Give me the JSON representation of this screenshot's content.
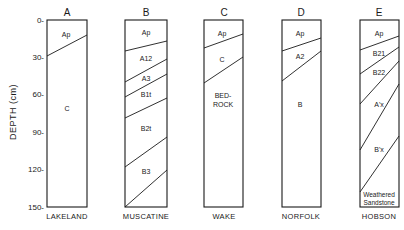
{
  "axis": {
    "label": "DEPTH (cm)",
    "ticks": [
      "0-",
      "30-",
      "60-",
      "90-",
      "120-",
      "150-"
    ],
    "tick_values": [
      0,
      30,
      60,
      90,
      120,
      150
    ]
  },
  "columns": [
    {
      "letter": "A",
      "name": "LAKELAND",
      "horizons": [
        "Ap",
        "C"
      ]
    },
    {
      "letter": "B",
      "name": "MUSCATINE",
      "horizons": [
        "Ap",
        "A12",
        "A3",
        "B1t",
        "B2t",
        "B3"
      ]
    },
    {
      "letter": "C",
      "name": "WAKE",
      "horizons": [
        "Ap",
        "C",
        "BED-",
        "ROCK"
      ]
    },
    {
      "letter": "D",
      "name": "NORFOLK",
      "horizons": [
        "Ap",
        "A2",
        "B"
      ]
    },
    {
      "letter": "E",
      "name": "HOBSON",
      "horizons": [
        "Ap",
        "B21",
        "B22",
        "A'x",
        "B'x",
        "Weathered",
        "Sandstone"
      ]
    }
  ],
  "colors": {
    "ink": "#1a1a1a",
    "background": "#ffffff"
  }
}
